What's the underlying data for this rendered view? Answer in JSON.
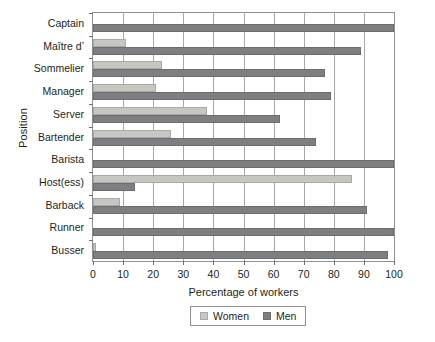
{
  "chart_data": {
    "type": "bar",
    "orientation": "horizontal",
    "title": "",
    "xlabel": "Percentage of workers",
    "ylabel": "Position",
    "xlim": [
      0,
      100
    ],
    "xticks": [
      0,
      10,
      20,
      30,
      40,
      50,
      60,
      70,
      80,
      90,
      100
    ],
    "grid": "vertical",
    "legend_position": "bottom-center",
    "categories": [
      "Captain",
      "Maître d’",
      "Sommelier",
      "Manager",
      "Server",
      "Bartender",
      "Barista",
      "Host(ess)",
      "Barback",
      "Runner",
      "Busser"
    ],
    "series": [
      {
        "name": "Women",
        "color": "#c6c7c3",
        "values": [
          0,
          11,
          23,
          21,
          38,
          26,
          0,
          86,
          9,
          0,
          1
        ]
      },
      {
        "name": "Men",
        "color": "#7e7f80",
        "values": [
          100,
          89,
          77,
          79,
          62,
          74,
          100,
          14,
          91,
          100,
          98
        ]
      }
    ]
  },
  "legend": {
    "entries": [
      {
        "label": "Women",
        "swatch": "women"
      },
      {
        "label": "Men",
        "swatch": "men"
      }
    ]
  }
}
